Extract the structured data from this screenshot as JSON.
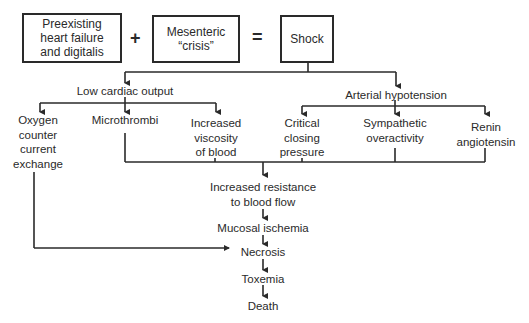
{
  "top_row": {
    "box1": {
      "line1": "Preexisting",
      "line2": "heart failure",
      "line3": "and digitalis"
    },
    "plus": "+",
    "box2": {
      "line1": "Mesenteric",
      "line2": "“crisis”"
    },
    "equals": "=",
    "box3": {
      "line1": "Shock"
    }
  },
  "branches": {
    "left": {
      "title": "Low cardiac output",
      "children": [
        {
          "lines": [
            "Oxygen",
            "counter",
            "current",
            "exchange"
          ]
        },
        {
          "lines": [
            "Microthrombi"
          ]
        },
        {
          "lines": [
            "Increased",
            "viscosity",
            "of blood"
          ]
        }
      ]
    },
    "right": {
      "title": "Arterial hypotension",
      "children": [
        {
          "lines": [
            "Critical",
            "closing",
            "pressure"
          ]
        },
        {
          "lines": [
            "Sympathetic",
            "overactivity"
          ]
        },
        {
          "lines": [
            "Renin",
            "angiotensin"
          ]
        }
      ]
    }
  },
  "chain": {
    "step1": {
      "line1": "Increased resistance",
      "line2": "to blood flow"
    },
    "step2": "Mucosal ischemia",
    "step3": "Necrosis",
    "step4": "Toxemia",
    "step5": "Death"
  },
  "colors": {
    "ink": "#2a2a2a",
    "background": "#ffffff"
  }
}
